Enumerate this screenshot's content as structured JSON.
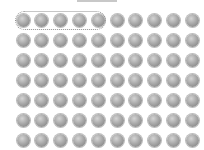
{
  "figure": {
    "rows": 7,
    "columns": 10,
    "total_dots": 70,
    "dot_color": "#9a9a9a",
    "group": {
      "row": 0,
      "start_column": 0,
      "count": 5,
      "outline_color": "#8f8f8f"
    }
  }
}
